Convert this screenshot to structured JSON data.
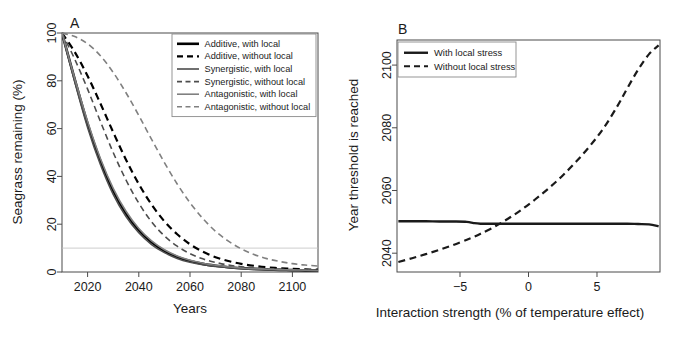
{
  "figure": {
    "background": "#ffffff",
    "width": 673,
    "height": 338
  },
  "panel_a": {
    "letter": "A",
    "legend": {
      "items": [
        {
          "label": "Additive, with local",
          "style": "solid",
          "color": "#000000",
          "width": 2.6
        },
        {
          "label": "Additive, without local",
          "style": "dashed",
          "color": "#000000",
          "width": 2.2
        },
        {
          "label": "Synergistic, with local",
          "style": "solid",
          "color": "#4d4d4d",
          "width": 1.6
        },
        {
          "label": "Synergistic, without local",
          "style": "dashed",
          "color": "#4d4d4d",
          "width": 1.6
        },
        {
          "label": "Antagonistic, with local",
          "style": "solid",
          "color": "#808080",
          "width": 1.6
        },
        {
          "label": "Antagonistic, without local",
          "style": "dashed",
          "color": "#808080",
          "width": 1.6
        }
      ]
    }
  },
  "panel_b": {
    "letter": "B",
    "legend": {
      "items": [
        {
          "label": "With local stress",
          "style": "solid",
          "color": "#1a1a1a",
          "width": 2.4
        },
        {
          "label": "Without local stress",
          "style": "dashed",
          "color": "#1a1a1a",
          "width": 2.2
        }
      ]
    }
  },
  "chart_data": [
    {
      "id": "panel-a",
      "type": "line",
      "title": "A",
      "xlabel": "Years",
      "ylabel": "Seagrass remaining (%)",
      "xlim": [
        2010,
        2110
      ],
      "ylim": [
        0,
        100
      ],
      "xticks": [
        2020,
        2040,
        2060,
        2080,
        2100
      ],
      "yticks": [
        0,
        20,
        40,
        60,
        80,
        100
      ],
      "xticklabels": [
        "2020",
        "2040",
        "2060",
        "2080",
        "2100"
      ],
      "yticklabels": [
        "0",
        "20",
        "40",
        "60",
        "80",
        "100"
      ],
      "grid": false,
      "legend_position": "top-right",
      "threshold_line": {
        "y": 10,
        "color": "#c0c0c0",
        "style": "solid",
        "width": 0.8
      },
      "x": [
        2010,
        2015,
        2020,
        2025,
        2030,
        2035,
        2040,
        2045,
        2050,
        2055,
        2060,
        2065,
        2070,
        2075,
        2080,
        2085,
        2090,
        2095,
        2100,
        2105,
        2110
      ],
      "series": [
        {
          "name": "Additive, with local",
          "style": "solid",
          "color": "#000000",
          "width": 2.6,
          "values": [
            100,
            80.5,
            62.0,
            46.5,
            34.0,
            24.5,
            17.5,
            12.4,
            8.8,
            6.3,
            4.6,
            3.4,
            2.6,
            2.0,
            1.6,
            1.3,
            1.1,
            0.9,
            0.8,
            0.7,
            0.6
          ]
        },
        {
          "name": "Additive, without local",
          "style": "dashed",
          "color": "#000000",
          "width": 2.2,
          "values": [
            100,
            92.0,
            82.0,
            70.5,
            58.5,
            47.0,
            36.8,
            28.2,
            21.2,
            15.8,
            11.6,
            8.5,
            6.2,
            4.6,
            3.4,
            2.6,
            2.0,
            1.6,
            1.3,
            1.1,
            1.0
          ]
        },
        {
          "name": "Synergistic, with local",
          "style": "solid",
          "color": "#4d4d4d",
          "width": 1.6,
          "values": [
            100,
            79.5,
            60.5,
            45.0,
            32.5,
            23.2,
            16.4,
            11.5,
            8.1,
            5.7,
            4.1,
            3.0,
            2.3,
            1.8,
            1.4,
            1.1,
            0.9,
            0.8,
            0.7,
            0.6,
            0.5
          ]
        },
        {
          "name": "Synergistic, without local",
          "style": "dashed",
          "color": "#4d4d4d",
          "width": 1.6,
          "values": [
            100,
            89.0,
            76.5,
            63.0,
            50.0,
            38.5,
            28.8,
            21.0,
            15.1,
            10.8,
            7.7,
            5.5,
            4.0,
            2.9,
            2.2,
            1.7,
            1.4,
            1.1,
            0.9,
            0.8,
            0.7
          ]
        },
        {
          "name": "Antagonistic, with local",
          "style": "solid",
          "color": "#808080",
          "width": 1.6,
          "values": [
            100,
            81.0,
            63.0,
            47.5,
            35.0,
            25.4,
            18.2,
            13.0,
            9.3,
            6.7,
            4.9,
            3.7,
            2.8,
            2.2,
            1.7,
            1.4,
            1.2,
            1.0,
            0.9,
            0.8,
            0.7
          ]
        },
        {
          "name": "Antagonistic, without local",
          "style": "dashed",
          "color": "#808080",
          "width": 1.6,
          "values": [
            100,
            98.5,
            95.5,
            90.5,
            83.5,
            75.0,
            65.5,
            55.5,
            45.8,
            36.8,
            29.0,
            22.4,
            17.0,
            12.9,
            9.7,
            7.3,
            5.6,
            4.4,
            3.5,
            2.9,
            2.5
          ]
        }
      ]
    },
    {
      "id": "panel-b",
      "type": "line",
      "title": "B",
      "xlabel": "Interaction strength (% of temperature effect)",
      "ylabel": "Year threshold is reached",
      "xlim": [
        -9.6,
        9.6
      ],
      "ylim": [
        2034,
        2108
      ],
      "xticks": [
        -10,
        -5,
        0,
        5,
        10
      ],
      "yticks": [
        2040,
        2060,
        2080,
        2100
      ],
      "xticklabels": [
        "−10",
        "−5",
        "0",
        "5",
        "10"
      ],
      "yticklabels": [
        "2040",
        "2060",
        "2080",
        "2100"
      ],
      "grid": false,
      "legend_position": "top-left",
      "x": [
        -9.5,
        -8.5,
        -7.5,
        -6.5,
        -5.5,
        -4.5,
        -4.0,
        -3.5,
        -2.5,
        -1.5,
        -0.5,
        0.5,
        1.5,
        2.5,
        3.5,
        4.5,
        5.5,
        6.5,
        7.2,
        8.0,
        8.8,
        9.5
      ],
      "series": [
        {
          "name": "With local stress",
          "style": "solid",
          "color": "#1a1a1a",
          "width": 2.4,
          "values": [
            2050.2,
            2050.2,
            2050.2,
            2050.1,
            2050.1,
            2050.0,
            2049.6,
            2049.4,
            2049.4,
            2049.4,
            2049.4,
            2049.4,
            2049.4,
            2049.4,
            2049.4,
            2049.4,
            2049.4,
            2049.4,
            2049.4,
            2049.3,
            2049.2,
            2048.6
          ]
        },
        {
          "name": "Without local stress",
          "style": "dashed",
          "color": "#1a1a1a",
          "width": 2.2,
          "values": [
            2037.2,
            2038.4,
            2039.7,
            2041.1,
            2042.6,
            2044.3,
            2045.2,
            2046.2,
            2048.4,
            2051.0,
            2053.9,
            2057.2,
            2060.8,
            2064.8,
            2069.3,
            2074.3,
            2080.0,
            2087.0,
            2092.5,
            2098.5,
            2103.5,
            2106.3
          ]
        }
      ]
    }
  ]
}
